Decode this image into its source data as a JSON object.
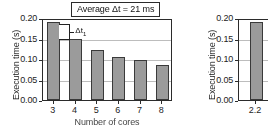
{
  "figure": {
    "title_box": "Average Δt = 21 ms",
    "annotation_label": "Δt",
    "annotation_sub": "1"
  },
  "chart_data": [
    {
      "type": "bar",
      "panel": "left",
      "title": "Average Δt = 21 ms",
      "xlabel": "Number of cores",
      "ylabel": "Execution time (s)",
      "categories": [
        "3",
        "4",
        "5",
        "6",
        "7",
        "8"
      ],
      "values": [
        0.19,
        0.15,
        0.122,
        0.105,
        0.098,
        0.086
      ],
      "ylim": [
        0.0,
        0.2
      ],
      "yticks": [
        "0.00",
        "0.05",
        "0.10",
        "0.15",
        "0.20"
      ],
      "ytick_values": [
        0.0,
        0.05,
        0.1,
        0.15,
        0.2
      ],
      "grid": true,
      "legend": "none",
      "bar_color": "#9b9b9b",
      "bar_edge_color": "#3a3a3a",
      "annotations": [
        {
          "label": "Δt₁",
          "from_value": 0.19,
          "to_value": 0.15,
          "between_categories": [
            "3",
            "4"
          ]
        }
      ]
    },
    {
      "type": "bar",
      "panel": "right",
      "xlabel": "",
      "ylabel": "Execution time (s)",
      "categories": [
        "2.2"
      ],
      "values": [
        0.19
      ],
      "ylim": [
        0.0,
        0.2
      ],
      "yticks": [
        "0.00",
        "0.05",
        "0.10",
        "0.15",
        "0.20"
      ],
      "ytick_values": [
        0.0,
        0.05,
        0.1,
        0.15,
        0.2
      ],
      "grid": true,
      "legend": "none",
      "bar_color": "#9b9b9b",
      "bar_edge_color": "#3a3a3a"
    }
  ]
}
